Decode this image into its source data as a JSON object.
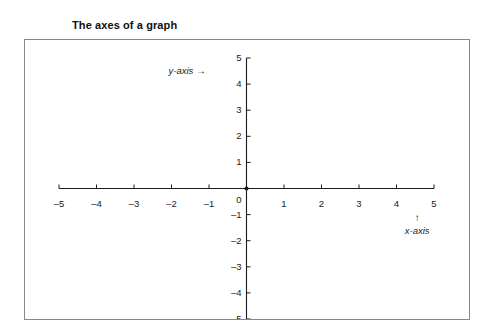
{
  "figure": {
    "title": "The axes of a graph",
    "background_color": "#ffffff",
    "frame_color": "#888888",
    "axis_color": "#1a1a1a"
  },
  "annotations": {
    "y_axis_label": "y-axis",
    "y_axis_arrow": "→",
    "x_axis_label": "x-axis",
    "x_axis_arrow": "↑"
  },
  "chart_data": {
    "type": "scatter",
    "title": "The axes of a graph",
    "xlabel": "x-axis",
    "ylabel": "y-axis",
    "xlim": [
      -5,
      5
    ],
    "ylim": [
      -5,
      5
    ],
    "grid": false,
    "legend": false,
    "x": [],
    "y": [],
    "series": [],
    "xticks": [
      -5,
      -4,
      -3,
      -2,
      -1,
      0,
      1,
      2,
      3,
      4,
      5
    ],
    "yticks": [
      5,
      4,
      3,
      2,
      1,
      0,
      -1,
      -2,
      -3,
      -4,
      -5
    ],
    "xtick_labels": [
      "–5",
      "–4",
      "–3",
      "–2",
      "–1",
      "0",
      "1",
      "2",
      "3",
      "4",
      "5"
    ],
    "ytick_labels": [
      "5",
      "4",
      "3",
      "2",
      "1",
      "0",
      "–1",
      "–2",
      "–3",
      "–4",
      "–5"
    ],
    "annotations": [
      {
        "text": "y-axis →",
        "x": -1.8,
        "y": 4.5
      },
      {
        "text": "↑",
        "x": 4.55,
        "y": -1.05
      },
      {
        "text": "x-axis",
        "x": 4.55,
        "y": -1.75
      }
    ]
  }
}
